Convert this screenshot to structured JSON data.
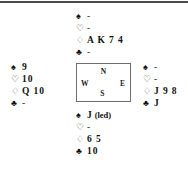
{
  "diagram": {
    "type": "bridge-deal-diagram",
    "suit_glyphs": {
      "spades": "♠",
      "hearts": "♡",
      "diamonds": "♢",
      "clubs": "♣"
    },
    "compass": {
      "north": "N",
      "west": "W",
      "east": "E",
      "south": "S"
    },
    "hands": {
      "north": {
        "label": "North",
        "spades": "-",
        "hearts": "-",
        "diamonds": "A K 7 4",
        "clubs": "-"
      },
      "west": {
        "label": "West",
        "spades": "9",
        "hearts": "10",
        "diamonds": "Q 10",
        "clubs": "-"
      },
      "east": {
        "label": "East",
        "spades": "-",
        "hearts": "-",
        "diamonds": "J 9 8",
        "clubs": "J"
      },
      "south": {
        "label": "South",
        "spades": "J",
        "spades_note": "(led)",
        "hearts": "-",
        "diamonds": "6 5",
        "clubs": "10"
      }
    }
  }
}
